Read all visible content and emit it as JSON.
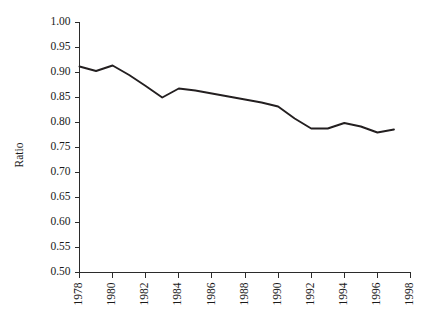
{
  "chart_data": {
    "type": "line",
    "title": "",
    "xlabel": "",
    "ylabel": "Ratio",
    "xlim": [
      1977,
      1998
    ],
    "ylim": [
      0.5,
      1.0
    ],
    "grid": false,
    "legend": null,
    "y_ticks": [
      "0.50",
      "0.55",
      "0.60",
      "0.65",
      "0.70",
      "0.75",
      "0.80",
      "0.85",
      "0.90",
      "0.95",
      "1.00"
    ],
    "y_tick_values": [
      0.5,
      0.55,
      0.6,
      0.65,
      0.7,
      0.75,
      0.8,
      0.85,
      0.9,
      0.95,
      1.0
    ],
    "x_ticks": [
      "1978",
      "1980",
      "1982",
      "1984",
      "1986",
      "1988",
      "1990",
      "1992",
      "1994",
      "1996",
      "1998"
    ],
    "x_tick_values": [
      1978,
      1980,
      1982,
      1984,
      1986,
      1988,
      1990,
      1992,
      1994,
      1996,
      1998
    ],
    "x": [
      1978,
      1979,
      1980,
      1981,
      1982,
      1983,
      1984,
      1985,
      1986,
      1987,
      1988,
      1989,
      1990,
      1991,
      1992,
      1993,
      1994,
      1995,
      1996,
      1997
    ],
    "values": [
      0.912,
      0.903,
      0.914,
      0.895,
      0.873,
      0.85,
      0.868,
      0.864,
      0.858,
      0.852,
      0.846,
      0.84,
      0.832,
      0.808,
      0.788,
      0.788,
      0.799,
      0.792,
      0.78,
      0.786
    ],
    "series": [
      {
        "name": "Ratio",
        "color": "#231f20",
        "values": [
          0.912,
          0.903,
          0.914,
          0.895,
          0.873,
          0.85,
          0.868,
          0.864,
          0.858,
          0.852,
          0.846,
          0.84,
          0.832,
          0.808,
          0.788,
          0.788,
          0.799,
          0.792,
          0.78,
          0.786
        ]
      }
    ]
  },
  "axes": {
    "y_axis_label": "Ratio",
    "x_tick_rotation": "90"
  }
}
